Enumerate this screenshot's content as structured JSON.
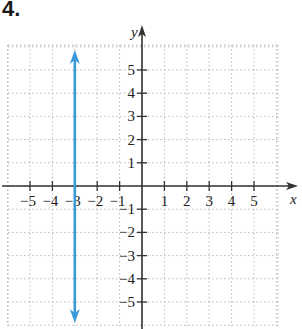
{
  "problem_number": "4.",
  "chart_data": {
    "type": "line",
    "title": "",
    "xlabel": "x",
    "ylabel": "y",
    "xlim": [
      -6,
      6
    ],
    "ylim": [
      -6,
      6
    ],
    "grid": true,
    "x_ticks": [
      -5,
      -4,
      -3,
      -2,
      -1,
      1,
      2,
      3,
      4,
      5
    ],
    "y_ticks": [
      -5,
      -4,
      -3,
      -2,
      -1,
      1,
      2,
      3,
      4,
      5
    ],
    "x_tick_labels": [
      "−5",
      "−4",
      "−3",
      "−2",
      "−1",
      "1",
      "2",
      "3",
      "4",
      "5"
    ],
    "y_tick_labels": [
      "−5",
      "−4",
      "−3",
      "−2",
      "−1",
      "1",
      "2",
      "3",
      "4",
      "5"
    ],
    "series": [
      {
        "name": "x = -3",
        "kind": "vertical-line",
        "x": [
          -3,
          -3
        ],
        "y": [
          -6,
          6
        ],
        "arrows": "both",
        "color": "#3a9ad9"
      }
    ]
  },
  "colors": {
    "line": "#3a9ad9",
    "axis": "#333333",
    "grid": "#b8b8b8"
  }
}
